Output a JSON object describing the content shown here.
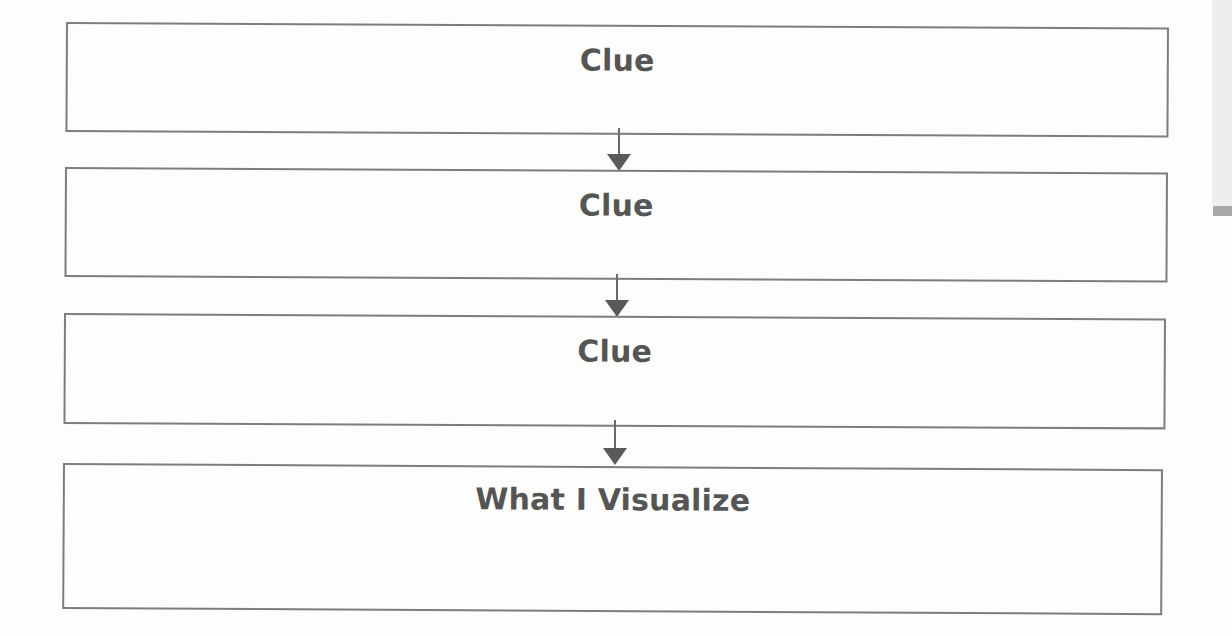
{
  "diagram": {
    "type": "flowchart",
    "direction": "top-to-bottom",
    "nodes": [
      {
        "id": "clue-1",
        "label": "Clue"
      },
      {
        "id": "clue-2",
        "label": "Clue"
      },
      {
        "id": "clue-3",
        "label": "Clue"
      },
      {
        "id": "visualize",
        "label": "What I Visualize"
      }
    ],
    "edges": [
      {
        "from": "clue-1",
        "to": "clue-2"
      },
      {
        "from": "clue-2",
        "to": "clue-3"
      },
      {
        "from": "clue-3",
        "to": "visualize"
      }
    ]
  },
  "colors": {
    "border": "#7d7d7d",
    "text": "#555555",
    "arrow": "#5a5a5a",
    "background": "#fdfdfc"
  }
}
